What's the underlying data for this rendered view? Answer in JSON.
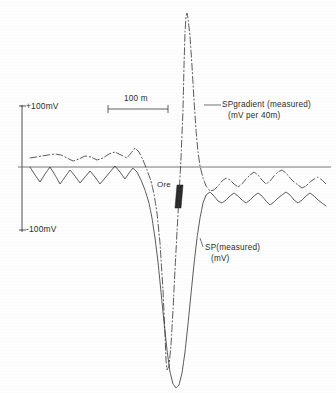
{
  "figure": {
    "background_color": "#fefefe",
    "ink_color": "#2b2b2b"
  },
  "axes": {
    "y_axis_name": "sp-voltage-axis",
    "zero_line_name": "zero-baseline",
    "tick_top_label": "+100mV",
    "tick_bottom_label": "-100mV"
  },
  "scalebar": {
    "label": "100 m"
  },
  "annotations": {
    "ore_label": "Ore",
    "sp_gradient_label_line1": "SPgradient (measured)",
    "sp_gradient_label_line2": "(mV per 40m)",
    "sp_measured_label_line1": "SP(measured)",
    "sp_measured_label_line2": "(mV)"
  },
  "chart_data": {
    "type": "line",
    "title": "",
    "xlabel": "",
    "ylabel": "",
    "ylim": [
      -100,
      100
    ],
    "y_tick_values": [
      100,
      -100
    ],
    "y_tick_labels": [
      "+100mV",
      "-100mV"
    ],
    "grid": false,
    "legend_position": "inline-annotations",
    "scalebar_meters": 100,
    "annotations": [
      {
        "name": "ore-body",
        "label": "Ore",
        "x_px": 179,
        "y_px": 196
      },
      {
        "name": "sp-gradient-callout",
        "label": "SPgradient (measured) (mV per 40m)"
      },
      {
        "name": "sp-measured-callout",
        "label": "SP(measured) (mV)"
      }
    ],
    "series": [
      {
        "name": "SPgradient (measured)",
        "units": "mV per 40m",
        "style": "dash-dot",
        "points_px": [
          [
            30,
            158
          ],
          [
            36,
            157
          ],
          [
            42,
            156
          ],
          [
            48,
            155
          ],
          [
            55,
            154
          ],
          [
            61,
            155
          ],
          [
            67,
            158
          ],
          [
            73,
            161
          ],
          [
            79,
            159
          ],
          [
            85,
            156
          ],
          [
            91,
            157
          ],
          [
            97,
            160
          ],
          [
            103,
            158
          ],
          [
            109,
            154
          ],
          [
            115,
            152
          ],
          [
            121,
            155
          ],
          [
            127,
            158
          ],
          [
            131,
            153
          ],
          [
            135,
            148
          ],
          [
            139,
            152
          ],
          [
            143,
            160
          ],
          [
            147,
            170
          ],
          [
            151,
            181
          ],
          [
            154,
            194
          ],
          [
            157,
            213
          ],
          [
            160,
            243
          ],
          [
            163,
            290
          ],
          [
            165,
            334
          ],
          [
            166,
            360
          ],
          [
            167,
            370
          ],
          [
            169,
            366
          ],
          [
            171,
            345
          ],
          [
            173,
            310
          ],
          [
            175,
            270
          ],
          [
            177,
            232
          ],
          [
            179,
            196
          ],
          [
            181,
            158
          ],
          [
            183,
            110
          ],
          [
            184,
            66
          ],
          [
            185,
            32
          ],
          [
            186,
            17
          ],
          [
            187,
            13
          ],
          [
            188,
            18
          ],
          [
            190,
            36
          ],
          [
            192,
            66
          ],
          [
            194,
            100
          ],
          [
            196,
            130
          ],
          [
            198,
            152
          ],
          [
            200,
            166
          ],
          [
            203,
            178
          ],
          [
            206,
            186
          ],
          [
            210,
            191
          ],
          [
            214,
            190
          ],
          [
            218,
            186
          ],
          [
            222,
            181
          ],
          [
            226,
            178
          ],
          [
            230,
            180
          ],
          [
            234,
            184
          ],
          [
            238,
            187
          ],
          [
            242,
            184
          ],
          [
            246,
            179
          ],
          [
            250,
            175
          ],
          [
            254,
            172
          ],
          [
            258,
            175
          ],
          [
            262,
            180
          ],
          [
            266,
            184
          ],
          [
            270,
            181
          ],
          [
            274,
            176
          ],
          [
            278,
            172
          ],
          [
            282,
            170
          ],
          [
            286,
            173
          ],
          [
            290,
            178
          ],
          [
            294,
            182
          ],
          [
            298,
            185
          ],
          [
            302,
            188
          ],
          [
            306,
            186
          ],
          [
            310,
            182
          ],
          [
            314,
            179
          ],
          [
            318,
            177
          ],
          [
            322,
            180
          ],
          [
            326,
            184
          ]
        ]
      },
      {
        "name": "SP (measured)",
        "units": "mV",
        "style": "solid",
        "points_px": [
          [
            30,
            167
          ],
          [
            35,
            175
          ],
          [
            40,
            182
          ],
          [
            45,
            174
          ],
          [
            50,
            167
          ],
          [
            55,
            175
          ],
          [
            60,
            184
          ],
          [
            65,
            177
          ],
          [
            70,
            170
          ],
          [
            75,
            176
          ],
          [
            80,
            183
          ],
          [
            85,
            177
          ],
          [
            90,
            171
          ],
          [
            95,
            177
          ],
          [
            100,
            184
          ],
          [
            105,
            178
          ],
          [
            110,
            172
          ],
          [
            115,
            166
          ],
          [
            120,
            172
          ],
          [
            125,
            179
          ],
          [
            129,
            173
          ],
          [
            133,
            168
          ],
          [
            137,
            172
          ],
          [
            141,
            180
          ],
          [
            145,
            190
          ],
          [
            149,
            203
          ],
          [
            152,
            218
          ],
          [
            155,
            238
          ],
          [
            158,
            262
          ],
          [
            161,
            292
          ],
          [
            164,
            322
          ],
          [
            167,
            350
          ],
          [
            170,
            372
          ],
          [
            173,
            384
          ],
          [
            176,
            388
          ],
          [
            179,
            385
          ],
          [
            182,
            373
          ],
          [
            185,
            352
          ],
          [
            188,
            324
          ],
          [
            191,
            294
          ],
          [
            194,
            264
          ],
          [
            197,
            238
          ],
          [
            200,
            218
          ],
          [
            203,
            203
          ],
          [
            206,
            195
          ],
          [
            210,
            192
          ],
          [
            214,
            196
          ],
          [
            218,
            201
          ],
          [
            222,
            203
          ],
          [
            226,
            200
          ],
          [
            230,
            196
          ],
          [
            234,
            193
          ],
          [
            238,
            196
          ],
          [
            242,
            200
          ],
          [
            246,
            203
          ],
          [
            250,
            200
          ],
          [
            254,
            196
          ],
          [
            258,
            193
          ],
          [
            262,
            196
          ],
          [
            266,
            201
          ],
          [
            270,
            205
          ],
          [
            274,
            202
          ],
          [
            278,
            198
          ],
          [
            282,
            195
          ],
          [
            286,
            192
          ],
          [
            290,
            195
          ],
          [
            294,
            200
          ],
          [
            298,
            203
          ],
          [
            302,
            200
          ],
          [
            306,
            196
          ],
          [
            310,
            193
          ],
          [
            314,
            196
          ],
          [
            318,
            200
          ],
          [
            322,
            203
          ],
          [
            326,
            206
          ]
        ]
      }
    ]
  }
}
